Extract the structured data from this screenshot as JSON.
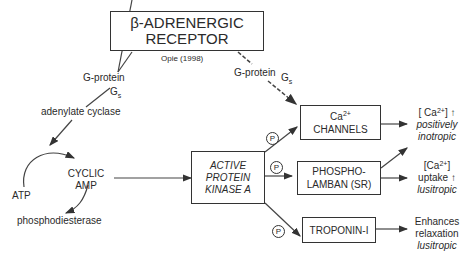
{
  "receptor": {
    "line1": "β-ADRENERGIC",
    "line2": "RECEPTOR"
  },
  "citation": "Opie (1998)",
  "left_path": {
    "gprotein": "G-protein",
    "gs_main": "G",
    "gs_sub": "s",
    "enzyme": "adenylate cyclase"
  },
  "right_path": {
    "gprotein": "G-protein",
    "gs_main": "G",
    "gs_sub": "s"
  },
  "cycle": {
    "atp": "ATP",
    "camp_line1": "CYCLIC",
    "camp_line2": "AMP",
    "degrader": "phosphodiesterase"
  },
  "pka": {
    "line1": "ACTIVE",
    "line2": "PROTEIN",
    "line3": "KINASE A"
  },
  "phospho_marker": "P",
  "targets": [
    {
      "line1_main": "Ca",
      "line1_sup": "2+",
      "line2": "CHANNELS"
    },
    {
      "line1": "PHOSPHO-",
      "line2": "LAMBAN (SR)"
    },
    {
      "line1": "TROPONIN-I"
    }
  ],
  "effects": [
    {
      "line1_main": "[ Ca",
      "line1_sup": "2+",
      "line1_end": "] ↑",
      "line2": "positively",
      "line3": "inotropic"
    },
    {
      "line1_main": "[Ca",
      "line1_sup": "2+",
      "line1_end": "]",
      "line2": "uptake ↑",
      "line3": "lusitropic"
    },
    {
      "line1": "Enhances",
      "line2": "relaxation",
      "line3": "lusitropic"
    }
  ]
}
